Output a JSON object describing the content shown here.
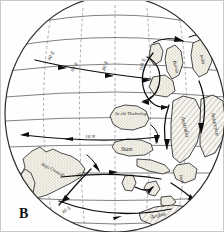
{
  "figure": {
    "panel_letter": "B",
    "type": "hand-drawn paleogeographic globe with ocean surface currents"
  },
  "grid_labels": {
    "lon_40E": "40 E",
    "lon_60E": "60 E",
    "lon_80E": "80 E",
    "lon_100E": "100 E",
    "lat_10N": "10 N",
    "lat_10S": "10 S",
    "lat_40S": "40 S"
  },
  "landmasses": [
    {
      "id": "baja-cronada",
      "label": "Baja Cronada"
    },
    {
      "id": "se-chi-thobrolog",
      "label": "Se chi Thobrolog"
    },
    {
      "id": "siam",
      "label": "Siam"
    },
    {
      "id": "australia",
      "label": "Australia"
    },
    {
      "id": "antarctica",
      "label": "Antarctica"
    },
    {
      "id": "arabia",
      "label": "Arabia"
    },
    {
      "id": "java",
      "label": "Java"
    },
    {
      "id": "burma",
      "label": "Burma"
    },
    {
      "id": "india",
      "label": "India"
    }
  ],
  "colors": {
    "outline": "#2b2b2b",
    "graticule": "#4a4a4a",
    "current": "#0d0d0d",
    "land_fill": "#f2efe6",
    "background": "#fefefe",
    "frame": "#c8c8c8"
  }
}
